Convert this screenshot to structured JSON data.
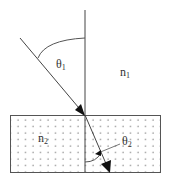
{
  "diagram": {
    "labels": {
      "theta1": "θ",
      "theta1_sub": "1",
      "n1": "n",
      "n1_sub": "1",
      "n2": "n",
      "n2_sub": "2",
      "theta2": "θ",
      "theta2_sub": "2"
    },
    "colors": {
      "line": "#444444",
      "dots": "#555555",
      "background": "#ffffff"
    }
  }
}
